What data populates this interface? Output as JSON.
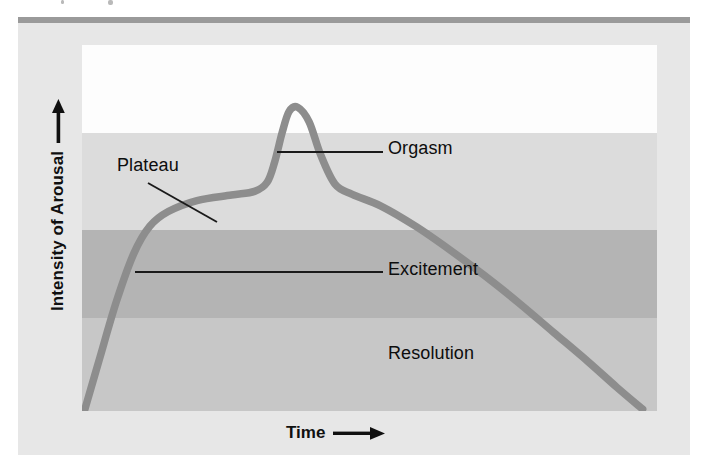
{
  "figure": {
    "axes": {
      "y_label": "Intensity of Arousal",
      "y_arrow_icon": "arrow-up-icon",
      "x_label": "Time",
      "x_arrow_icon": "arrow-right-icon"
    },
    "annotations": [
      {
        "id": "plateau",
        "label": "Plateau"
      },
      {
        "id": "orgasm",
        "label": "Orgasm"
      },
      {
        "id": "excitement",
        "label": "Excitement"
      },
      {
        "id": "resolution",
        "label": "Resolution"
      }
    ],
    "colors": {
      "page_background": "#ffffff",
      "panel_background": "#e7e7e7",
      "top_rule": "#9a9a9a",
      "band_top_white": "#fdfdfd",
      "band_light_gray": "#dcdcdc",
      "band_medium_gray": "#b4b4b4",
      "band_lower_gray": "#c7c7c7",
      "curve": "#8d8d8d",
      "leader_line": "#1a1a1a",
      "text": "#0d0d0d"
    },
    "bands": [
      {
        "name": "blank-upper-band",
        "color": "#fdfdfd",
        "top_px": 0,
        "height_px": 88
      },
      {
        "name": "orgasm-band",
        "color": "#dcdcdc",
        "top_px": 88,
        "height_px": 97
      },
      {
        "name": "excitement-band",
        "color": "#b4b4b4",
        "top_px": 185,
        "height_px": 88
      },
      {
        "name": "resolution-band",
        "color": "#c7c7c7",
        "top_px": 273,
        "height_px": 93
      }
    ]
  },
  "chart_data": {
    "type": "line",
    "title": "",
    "xlabel": "Time",
    "ylabel": "Intensity of Arousal",
    "xlim": [
      0,
      1
    ],
    "ylim": [
      0,
      1
    ],
    "grid": false,
    "legend": null,
    "axis_ticks": {
      "x": [],
      "y": []
    },
    "phase_bands": [
      {
        "label": "Orgasm",
        "y_range": [
          0.495,
          0.76
        ]
      },
      {
        "label": "Excitement",
        "y_range": [
          0.255,
          0.495
        ]
      },
      {
        "label": "Resolution",
        "y_range": [
          0.0,
          0.255
        ]
      }
    ],
    "series": [
      {
        "name": "Sexual response curve",
        "color": "#8d8d8d",
        "x": [
          0.005,
          0.03,
          0.06,
          0.09,
          0.118,
          0.15,
          0.2,
          0.26,
          0.3,
          0.322,
          0.335,
          0.348,
          0.36,
          0.375,
          0.395,
          0.415,
          0.44,
          0.47,
          0.52,
          0.58,
          0.64,
          0.7,
          0.76,
          0.82,
          0.88,
          0.93,
          0.975
        ],
        "y": [
          0.005,
          0.14,
          0.3,
          0.43,
          0.505,
          0.545,
          0.575,
          0.59,
          0.6,
          0.625,
          0.68,
          0.76,
          0.818,
          0.83,
          0.79,
          0.7,
          0.62,
          0.592,
          0.56,
          0.505,
          0.44,
          0.37,
          0.295,
          0.215,
          0.135,
          0.065,
          0.005
        ]
      }
    ],
    "annotations": [
      {
        "text": "Plateau",
        "points_to": [
          0.355,
          0.6
        ],
        "leader": "diagonal"
      },
      {
        "text": "Orgasm",
        "points_to": [
          0.36,
          0.826
        ],
        "leader": "horizontal"
      },
      {
        "text": "Excitement",
        "points_to": [
          0.122,
          0.5
        ],
        "leader": "horizontal"
      },
      {
        "text": "Resolution",
        "points_to": null,
        "leader": "none"
      }
    ]
  }
}
